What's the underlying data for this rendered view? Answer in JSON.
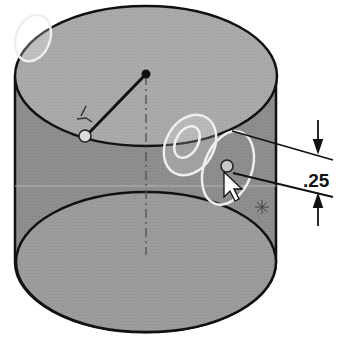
{
  "figure": {
    "dimension": {
      "label": ".25",
      "value": 0.25
    },
    "colors": {
      "background": "#ffffff",
      "top_face": "#a8a8a8",
      "side_face": "#8c8c8c",
      "bottom_face": "#9a9a9a",
      "edge": "#111111",
      "highlight": "#f2f2f2"
    },
    "elements": {
      "center_point": "sketch-center-point",
      "radius_line": "sketch-radius-line",
      "endpoint": "sketch-endpoint",
      "pointer": "mouse-cursor",
      "origin_marker": "origin-icon"
    }
  }
}
